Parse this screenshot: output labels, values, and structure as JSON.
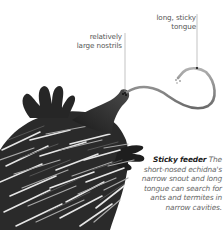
{
  "figure": {
    "labels": [
      {
        "id": "nostrils",
        "lines": [
          "relatively",
          "large nostrils"
        ]
      },
      {
        "id": "tongue",
        "lines": [
          "long, sticky",
          "tongue"
        ]
      }
    ],
    "caption": {
      "title": "Sticky feeder",
      "text": "The short-nosed echidna's narrow snout and long tongue can search for ants and termites in narrow cavities."
    },
    "colors": {
      "background": "#ffffff",
      "label_text": "#555555",
      "caption_title": "#222222",
      "caption_text": "#666666",
      "leader_line": "#999999",
      "body_dark": "#222222",
      "tongue": "#8a8a8a"
    }
  }
}
